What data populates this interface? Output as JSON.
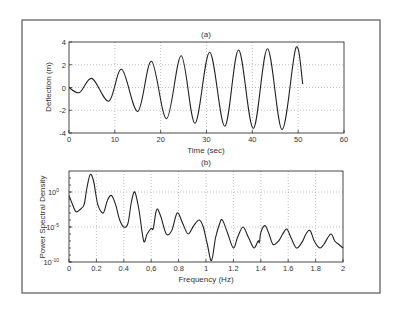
{
  "chart_data": [
    {
      "type": "line",
      "panel": "(a)",
      "title": "(a)",
      "xlabel": "Time (sec)",
      "ylabel": "Deflection (m)",
      "xlim": [
        0,
        60
      ],
      "ylim": [
        -4,
        4
      ],
      "xticks": [
        0,
        10,
        20,
        30,
        40,
        50,
        60
      ],
      "yticks": [
        -4,
        -2,
        0,
        2,
        4
      ],
      "grid": true,
      "legend": null,
      "series": [
        {
          "name": "deflection",
          "x": [
            0,
            2.3,
            5,
            8.7,
            11.5,
            15,
            18,
            21.3,
            24.5,
            27.5,
            30.7,
            34,
            37,
            40.2,
            43.3,
            46.5,
            49.5,
            51
          ],
          "y": [
            0,
            -0.45,
            0.8,
            -1.2,
            1.6,
            -2.1,
            2.3,
            -2.75,
            2.8,
            -3.15,
            3.1,
            -3.4,
            3.3,
            -3.6,
            3.4,
            -3.7,
            3.5,
            0.3
          ]
        }
      ]
    },
    {
      "type": "line",
      "panel": "(b)",
      "title": "(b)",
      "xlabel": "Frequency (Hz)",
      "ylabel": "Power Spectral Density",
      "xlim": [
        0,
        2
      ],
      "ylim_log10": [
        -10,
        3
      ],
      "yscale": "log",
      "xticks": [
        0,
        0.2,
        0.4,
        0.6,
        0.8,
        1,
        1.2,
        1.4,
        1.6,
        1.8,
        2
      ],
      "xtick_labels": [
        "0",
        "0.2",
        "0.4",
        "0,6",
        "0.8",
        "1",
        "1.2",
        "1.4",
        "1.6",
        "1.8",
        "2"
      ],
      "yticks_log10": [
        -10,
        -5,
        0
      ],
      "ytick_labels": [
        "10^-10",
        "10^-5",
        "10^0"
      ],
      "grid": true,
      "legend": null,
      "series": [
        {
          "name": "psd",
          "x": [
            0,
            0.02,
            0.05,
            0.08,
            0.11,
            0.13,
            0.155,
            0.18,
            0.21,
            0.25,
            0.28,
            0.31,
            0.34,
            0.37,
            0.4,
            0.43,
            0.455,
            0.48,
            0.51,
            0.545,
            0.57,
            0.6,
            0.615,
            0.64,
            0.67,
            0.71,
            0.75,
            0.79,
            0.83,
            0.87,
            0.91,
            0.95,
            0.98,
            1.01,
            1.04,
            1.07,
            1.1,
            1.12,
            1.16,
            1.2,
            1.23,
            1.27,
            1.31,
            1.35,
            1.38,
            1.39,
            1.4,
            1.43,
            1.46,
            1.49,
            1.53,
            1.56,
            1.59,
            1.62,
            1.66,
            1.7,
            1.73,
            1.76,
            1.79,
            1.83,
            1.86,
            1.91,
            1.94,
            1.97,
            2.0
          ],
          "log10_y": [
            -0.5,
            -1.5,
            -2.8,
            -2.5,
            -1.8,
            0.5,
            2.5,
            1.5,
            -1.8,
            -3.0,
            -1.2,
            -0.5,
            -1.8,
            -4.0,
            -5.0,
            -4.5,
            -1.5,
            0.0,
            -2.5,
            -7.0,
            -6.0,
            -5.2,
            -5.2,
            -2.5,
            -3.5,
            -6.0,
            -5.5,
            -3.0,
            -4.5,
            -6.0,
            -4.8,
            -4.0,
            -5.0,
            -7.5,
            -9.8,
            -6.5,
            -4.5,
            -4.0,
            -6.0,
            -8.0,
            -6.5,
            -5.0,
            -6.5,
            -8.0,
            -7.0,
            -7.2,
            -5.8,
            -4.8,
            -6.0,
            -7.5,
            -7.0,
            -6.0,
            -5.3,
            -6.5,
            -8.0,
            -7.2,
            -6.0,
            -5.5,
            -7.0,
            -8.0,
            -7.5,
            -6.0,
            -7.0,
            -7.5,
            -8.0
          ]
        }
      ]
    }
  ],
  "labels": {
    "a_title": "(a)",
    "a_xlabel": "Time (sec)",
    "a_ylabel": "Deflection (m)",
    "b_title": "(b)",
    "b_xlabel": "Frequency (Hz)",
    "b_ylabel": "Power Spectral Density"
  }
}
